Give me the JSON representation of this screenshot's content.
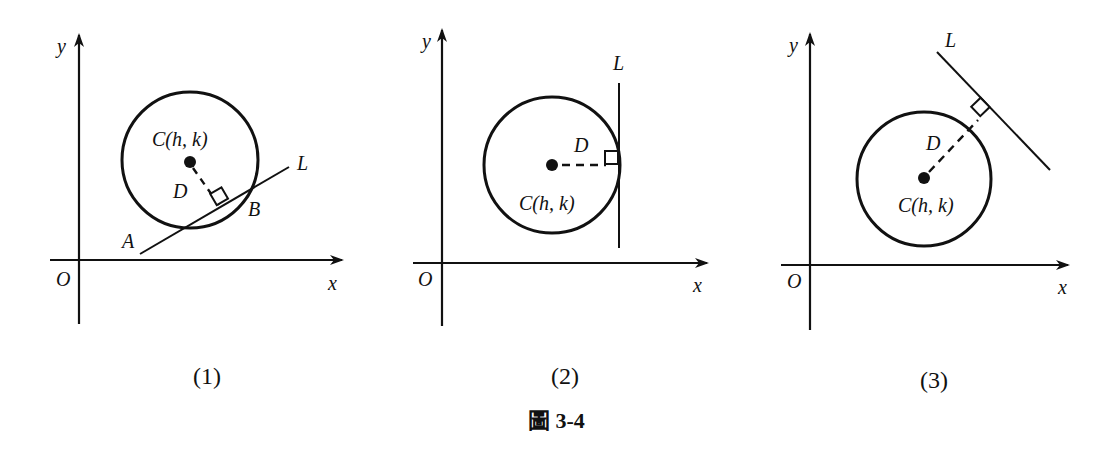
{
  "figure": {
    "caption": "圖 3-4",
    "panels": [
      {
        "id": "1",
        "caption": "(1)",
        "axes": {
          "x_label": "x",
          "y_label": "y",
          "origin_label": "O"
        },
        "center_label": "C(h,  k)",
        "foot_label": "D",
        "line_label": "L",
        "intersection_labels": [
          "A",
          "B"
        ],
        "relation": "secant"
      },
      {
        "id": "2",
        "caption": "(2)",
        "axes": {
          "x_label": "x",
          "y_label": "y",
          "origin_label": "O"
        },
        "center_label": "C(h,  k)",
        "foot_label": "D",
        "line_label": "L",
        "relation": "tangent"
      },
      {
        "id": "3",
        "caption": "(3)",
        "axes": {
          "x_label": "x",
          "y_label": "y",
          "origin_label": "O"
        },
        "center_label": "C(h,  k)",
        "foot_label": "D",
        "line_label": "L",
        "relation": "disjoint"
      }
    ]
  },
  "colors": {
    "stroke": "#111111",
    "background": "#ffffff"
  }
}
